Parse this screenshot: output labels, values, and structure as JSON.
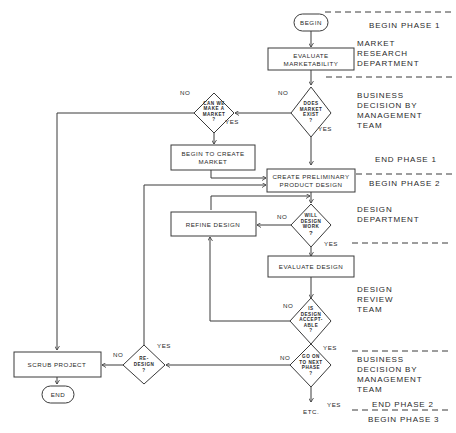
{
  "diagram": {
    "type": "flowchart",
    "nodes": {
      "begin": {
        "label": "BEGIN",
        "shape": "terminal"
      },
      "evaluate_marketability": {
        "line1": "EVALUATE",
        "line2": "MARKETABILITY",
        "shape": "process"
      },
      "does_market_exist": {
        "line1": "DOES",
        "line2": "MARKET",
        "line3": "EXIST",
        "line4": "?",
        "shape": "decision"
      },
      "can_we_make_market": {
        "line1": "CAN WE",
        "line2": "MAKE A",
        "line3": "MARKET",
        "line4": "?",
        "shape": "decision"
      },
      "begin_to_create_market": {
        "line1": "BEGIN TO CREATE",
        "line2": "MARKET",
        "shape": "process"
      },
      "create_preliminary_design": {
        "line1": "CREATE PRELIMINARY",
        "line2": "PRODUCT DESIGN",
        "shape": "process"
      },
      "will_design_work": {
        "line1": "WILL",
        "line2": "DESIGN",
        "line3": "WORK",
        "line4": "?",
        "shape": "decision"
      },
      "refine_design": {
        "label": "REFINE DESIGN",
        "shape": "process"
      },
      "evaluate_design": {
        "label": "EVALUATE DESIGN",
        "shape": "process"
      },
      "is_design_acceptable": {
        "line1": "IS",
        "line2": "DESIGN",
        "line3": "ACCEPT-",
        "line4": "ABLE",
        "line5": "?",
        "shape": "decision"
      },
      "go_on_next_phase": {
        "line1": "GO ON",
        "line2": "TO NEXT",
        "line3": "PHASE",
        "line4": "?",
        "shape": "decision"
      },
      "redesign": {
        "line1": "RE-",
        "line2": "DESIGN",
        "line3": "?",
        "shape": "decision"
      },
      "scrub_project": {
        "label": "SCRUB PROJECT",
        "shape": "process"
      },
      "end": {
        "label": "END",
        "shape": "terminal"
      },
      "etc": {
        "label": "ETC."
      }
    },
    "edge_labels": {
      "no": "NO",
      "yes": "YES"
    },
    "side_labels": {
      "begin_phase_1": "BEGIN  PHASE  1",
      "market_research": {
        "line1": "MARKET",
        "line2": "RESEARCH",
        "line3": "DEPARTMENT"
      },
      "business_decision_1": {
        "line1": "BUSINESS",
        "line2": "DECISION  BY",
        "line3": "MANAGEMENT",
        "line4": "TEAM"
      },
      "end_phase_1": "END  PHASE  1",
      "begin_phase_2": "BEGIN  PHASE  2",
      "design_department": {
        "line1": "DESIGN",
        "line2": "DEPARTMENT"
      },
      "design_review": {
        "line1": "DESIGN",
        "line2": "REVIEW",
        "line3": "TEAM"
      },
      "business_decision_2": {
        "line1": "BUSINESS",
        "line2": "DECISION  BY",
        "line3": "MANAGEMENT",
        "line4": "TEAM"
      },
      "end_phase_2": "END  PHASE  2",
      "begin_phase_3": "BEGIN  PHASE  3"
    },
    "colors": {
      "line": "#3a3a3a",
      "text": "#2a2a2a",
      "background": "#ffffff"
    }
  }
}
